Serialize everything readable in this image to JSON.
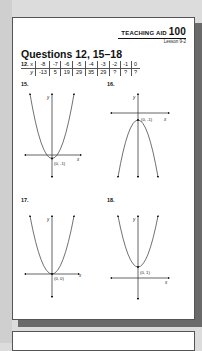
{
  "header": {
    "teaching_aid_label": "TEACHING AID",
    "teaching_aid_number": "100",
    "lesson": "Lesson 9-2"
  },
  "title": "Questions 12, 15–18",
  "question12": {
    "label": "12.",
    "row_labels": [
      "x",
      "y"
    ],
    "x_values": [
      "-8",
      "-7",
      "-6",
      "-5",
      "-4",
      "-3",
      "-2",
      "-1",
      "0"
    ],
    "y_values": [
      "-13",
      "5",
      "19",
      "29",
      "35",
      "29",
      "?",
      "?",
      "?"
    ]
  },
  "graphs": [
    {
      "label": "15.",
      "shape": "parabola opening up",
      "vertex_label": "(0, -1)",
      "x_axis_label": "x",
      "y_axis_label": "y"
    },
    {
      "label": "16.",
      "shape": "parabola opening down",
      "vertex_label": "(0, -1)",
      "x_axis_label": "x",
      "y_axis_label": "y"
    },
    {
      "label": "17.",
      "shape": "parabola opening up",
      "vertex_label": "(0, 0)",
      "x_axis_label": "x",
      "y_axis_label": "y"
    },
    {
      "label": "18.",
      "shape": "parabola opening up",
      "vertex_label": "(0, 1)",
      "x_axis_label": "x",
      "y_axis_label": "y"
    }
  ]
}
